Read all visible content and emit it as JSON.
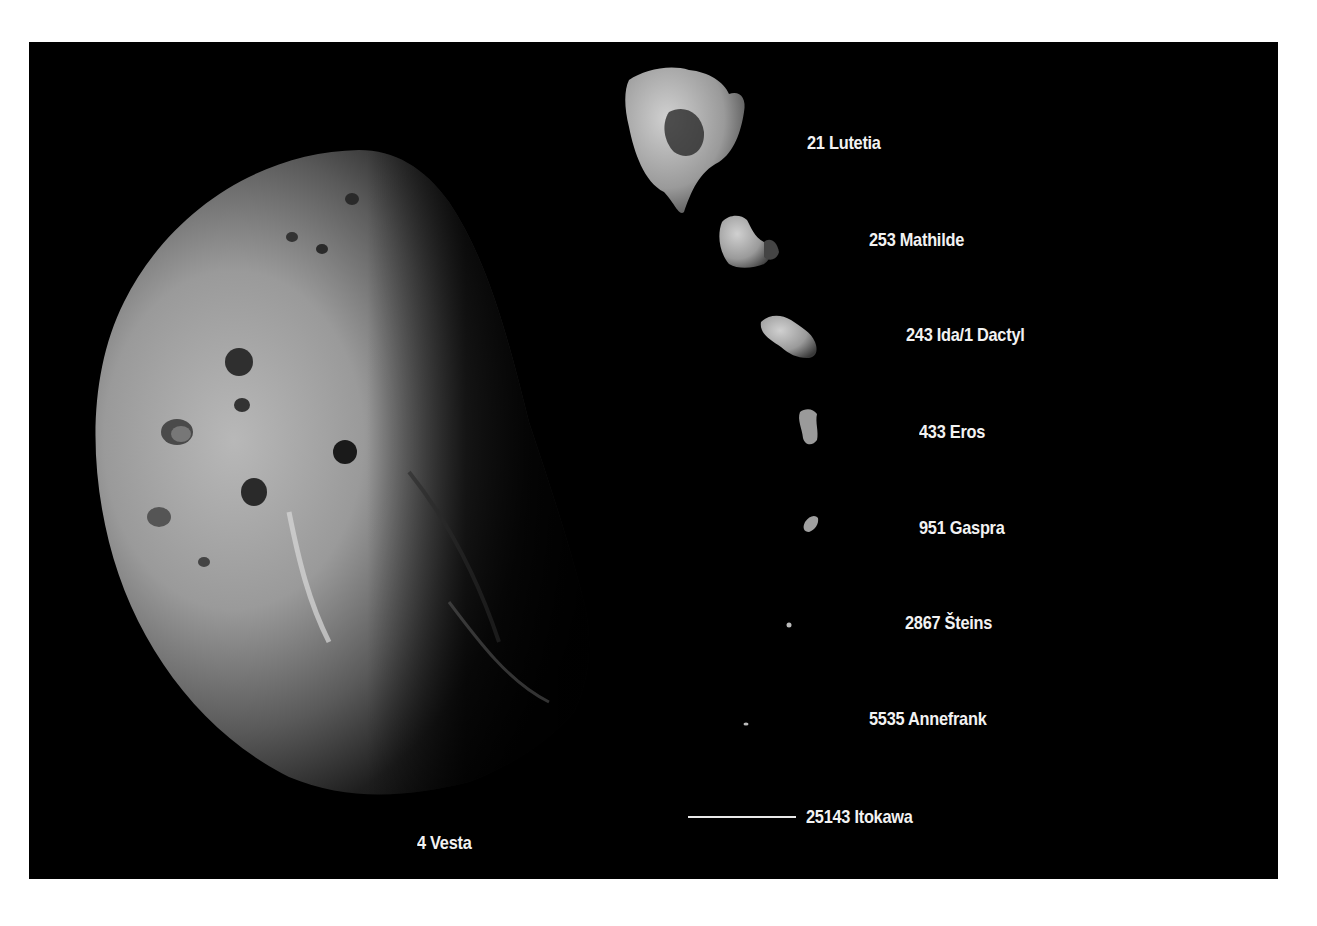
{
  "figure": {
    "background_color": "#000000",
    "page_color": "#ffffff",
    "text_color": "#f2f2f2"
  },
  "bodies": [
    {
      "id": "vesta",
      "label": "4 Vesta"
    },
    {
      "id": "lutetia",
      "label": "21 Lutetia"
    },
    {
      "id": "mathilde",
      "label": "253 Mathilde"
    },
    {
      "id": "ida",
      "label": "243 Ida/1 Dactyl"
    },
    {
      "id": "eros",
      "label": "433 Eros"
    },
    {
      "id": "gaspra",
      "label": "951 Gaspra"
    },
    {
      "id": "steins",
      "label": "2867 Šteins"
    },
    {
      "id": "annefrank",
      "label": "5535 Annefrank"
    },
    {
      "id": "itokawa",
      "label": "25143 Itokawa"
    }
  ]
}
